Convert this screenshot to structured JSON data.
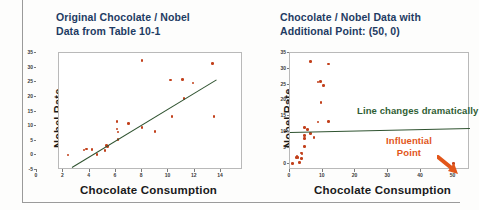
{
  "slide": {
    "background": "#fdfdfc",
    "frame_color": "#9a9a9a"
  },
  "colors": {
    "title": "#1e3b63",
    "point": "#c2401b",
    "regression_line": "#2f5330",
    "annotation_green": "#2f5e34",
    "annotation_orange": "#e2561a",
    "axis": "#6f6f6f"
  },
  "panels": [
    {
      "id": "left",
      "title": "Original Chocolate / Nobel\nData from Table 10-1",
      "xlabel": "Chocolate Consumption",
      "ylabel": "Nobel Rate"
    },
    {
      "id": "right",
      "title": "Chocolate / Nobel Data with\nAdditional Point: (50, 0)",
      "xlabel": "Chocolate Consumption",
      "ylabel": "Nobel Rate",
      "annotations": {
        "line_note": "Line changes dramatically",
        "influential_note": "Influential\nPoint"
      }
    }
  ],
  "chart_data": [
    {
      "type": "scatter",
      "title": "Original Chocolate / Nobel Data from Table 10-1",
      "xlabel": "Chocolate Consumption",
      "ylabel": "Nobel Rate",
      "xlim": [
        0,
        14
      ],
      "ylim": [
        -5,
        35
      ],
      "xticks": [
        0,
        2,
        4,
        6,
        8,
        10,
        12,
        14
      ],
      "yticks": [
        -5,
        0,
        5,
        10,
        15,
        20,
        25,
        30,
        35
      ],
      "grid": false,
      "legend": null,
      "series": [
        {
          "name": "Countries",
          "marker_color": "#c2401b",
          "points": [
            [
              0.7,
              0.1
            ],
            [
              1.9,
              1.9
            ],
            [
              2.1,
              2.2
            ],
            [
              2.5,
              2.0
            ],
            [
              2.9,
              0.3
            ],
            [
              3.5,
              1.6
            ],
            [
              3.6,
              3.4
            ],
            [
              3.7,
              3.0
            ],
            [
              4.4,
              11.5
            ],
            [
              4.4,
              9.0
            ],
            [
              4.5,
              8.0
            ],
            [
              4.5,
              5.5
            ],
            [
              5.3,
              10.8
            ],
            [
              6.3,
              32.4
            ],
            [
              6.3,
              9.5
            ],
            [
              7.3,
              8.2
            ],
            [
              8.5,
              25.8
            ],
            [
              8.6,
              13.2
            ],
            [
              9.4,
              25.9
            ],
            [
              9.5,
              19.4
            ],
            [
              10.2,
              24.8
            ],
            [
              11.7,
              31.5
            ],
            [
              11.8,
              13.3
            ]
          ]
        }
      ],
      "fit_line": {
        "name": "Least-squares regression line",
        "color": "#2f5330",
        "endpoints": [
          [
            1.0,
            -4.0
          ],
          [
            12.0,
            26.0
          ]
        ]
      }
    },
    {
      "type": "scatter",
      "title": "Chocolate / Nobel Data with Additional Point: (50, 0)",
      "xlabel": "Chocolate Consumption",
      "ylabel": "Nobel Rate",
      "xlim": [
        0,
        55
      ],
      "ylim": [
        -2,
        35
      ],
      "xticks": [
        0,
        10,
        20,
        30,
        40,
        50
      ],
      "yticks": [
        0,
        5,
        10,
        15,
        20,
        25,
        30,
        35
      ],
      "grid": false,
      "legend": null,
      "series": [
        {
          "name": "Countries",
          "marker_color": "#c2401b",
          "points": [
            [
              0.7,
              0.1
            ],
            [
              1.9,
              1.9
            ],
            [
              2.1,
              2.2
            ],
            [
              2.5,
              2.0
            ],
            [
              2.9,
              0.3
            ],
            [
              3.5,
              1.6
            ],
            [
              3.6,
              3.4
            ],
            [
              3.7,
              3.0
            ],
            [
              4.4,
              11.5
            ],
            [
              4.4,
              9.0
            ],
            [
              4.5,
              8.0
            ],
            [
              4.5,
              5.5
            ],
            [
              5.3,
              10.8
            ],
            [
              6.3,
              32.4
            ],
            [
              6.3,
              9.5
            ],
            [
              7.3,
              8.2
            ],
            [
              8.5,
              25.8
            ],
            [
              8.6,
              13.2
            ],
            [
              9.4,
              25.9
            ],
            [
              9.5,
              19.4
            ],
            [
              10.2,
              24.8
            ],
            [
              11.7,
              31.5
            ],
            [
              11.8,
              13.3
            ]
          ]
        },
        {
          "name": "Additional influential point",
          "marker_color": "#c2401b",
          "points": [
            [
              50,
              0
            ]
          ]
        }
      ],
      "fit_line": {
        "name": "Least-squares regression line with influential point",
        "color": "#2f5330",
        "endpoints": [
          [
            0.0,
            10.1
          ],
          [
            55.0,
            11.4
          ]
        ]
      },
      "annotations": [
        {
          "text": "Line changes dramatically",
          "color": "#2f5e34"
        },
        {
          "text": "Influential Point",
          "color": "#e2561a"
        }
      ]
    }
  ],
  "axes": {
    "left": {
      "yticks": [
        "35",
        "30",
        "25",
        "20",
        "15",
        "10",
        "5",
        "0",
        "-5"
      ],
      "xticks": [
        "0",
        "2",
        "4",
        "6",
        "8",
        "10",
        "12",
        "14"
      ]
    },
    "right": {
      "yticks": [
        "35",
        "30",
        "25",
        "20",
        "15",
        "10",
        "5",
        "0"
      ],
      "xticks": [
        "0",
        "10",
        "20",
        "30",
        "40",
        "50"
      ]
    }
  }
}
